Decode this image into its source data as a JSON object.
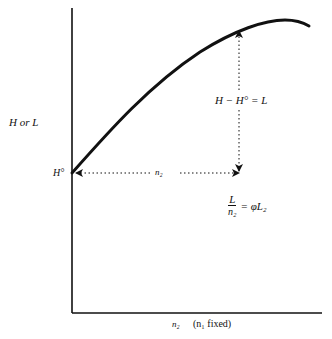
{
  "diagram": {
    "y_axis_label": "H  or  L",
    "x_axis_label": "n₂",
    "x_axis_note": "(n₁ fixed)",
    "origin_label": "H°",
    "horizontal_arrow_label": "n₂",
    "vertical_arrow_label": "H − H° = L",
    "fraction_numerator": "L",
    "fraction_denominator": "n₂",
    "fraction_rhs": "= φL₂",
    "curve_description": "concave curve rising from H° on the vertical axis to a maximum near the upper right, then slightly declining",
    "colors": {
      "ink": "#111111",
      "background": "#ffffff"
    }
  }
}
